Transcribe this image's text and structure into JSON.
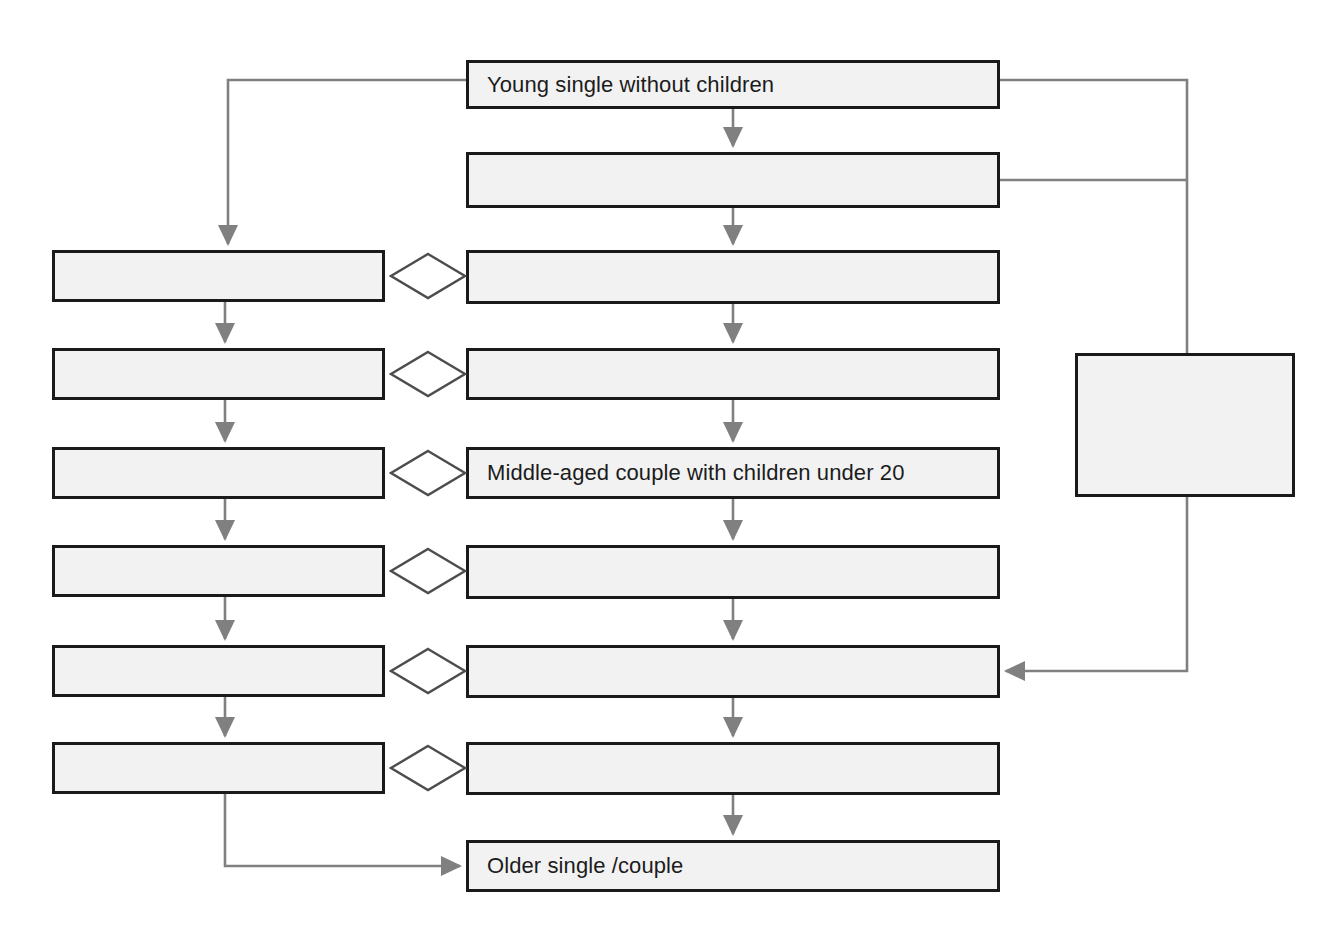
{
  "diagram": {
    "type": "flowchart",
    "canvas": {
      "width": 1342,
      "height": 932
    },
    "style": {
      "node_fill": "#f2f2f2",
      "node_border": "#1a1a1a",
      "edge_color": "#808080",
      "text_color": "#1c1c1c",
      "background": "#ffffff"
    },
    "columns": {
      "left_label": "",
      "middle_label": "",
      "right_label": ""
    },
    "nodes": [
      {
        "id": "m1",
        "label": "Young single without children",
        "column": "middle",
        "x": 466,
        "y": 60,
        "w": 534,
        "h": 49
      },
      {
        "id": "m2",
        "label": "",
        "column": "middle",
        "x": 466,
        "y": 152,
        "w": 534,
        "h": 56
      },
      {
        "id": "m3",
        "label": "",
        "column": "middle",
        "x": 466,
        "y": 250,
        "w": 534,
        "h": 54
      },
      {
        "id": "m4",
        "label": "",
        "column": "middle",
        "x": 466,
        "y": 348,
        "w": 534,
        "h": 52
      },
      {
        "id": "m5",
        "label": "Middle-aged couple with children under 20",
        "column": "middle",
        "x": 466,
        "y": 447,
        "w": 534,
        "h": 52
      },
      {
        "id": "m6",
        "label": "",
        "column": "middle",
        "x": 466,
        "y": 545,
        "w": 534,
        "h": 54
      },
      {
        "id": "m7",
        "label": "",
        "column": "middle",
        "x": 466,
        "y": 645,
        "w": 534,
        "h": 53
      },
      {
        "id": "m8",
        "label": "",
        "column": "middle",
        "x": 466,
        "y": 742,
        "w": 534,
        "h": 53
      },
      {
        "id": "m9",
        "label": "Older single /couple",
        "column": "middle",
        "x": 466,
        "y": 840,
        "w": 534,
        "h": 52
      },
      {
        "id": "l1",
        "label": "",
        "column": "left",
        "x": 52,
        "y": 250,
        "w": 333,
        "h": 52
      },
      {
        "id": "l2",
        "label": "",
        "column": "left",
        "x": 52,
        "y": 348,
        "w": 333,
        "h": 52
      },
      {
        "id": "l3",
        "label": "",
        "column": "left",
        "x": 52,
        "y": 447,
        "w": 333,
        "h": 52
      },
      {
        "id": "l4",
        "label": "",
        "column": "left",
        "x": 52,
        "y": 545,
        "w": 333,
        "h": 52
      },
      {
        "id": "l5",
        "label": "",
        "column": "left",
        "x": 52,
        "y": 645,
        "w": 333,
        "h": 52
      },
      {
        "id": "l6",
        "label": "",
        "column": "left",
        "x": 52,
        "y": 742,
        "w": 333,
        "h": 52
      },
      {
        "id": "r1",
        "label": "",
        "column": "right",
        "x": 1075,
        "y": 353,
        "w": 220,
        "h": 144
      }
    ],
    "diamonds": [
      {
        "id": "d1",
        "cx": 428,
        "cy": 276,
        "rx": 37,
        "ry": 22
      },
      {
        "id": "d2",
        "cx": 428,
        "cy": 374,
        "rx": 37,
        "ry": 22
      },
      {
        "id": "d3",
        "cx": 428,
        "cy": 473,
        "rx": 37,
        "ry": 22
      },
      {
        "id": "d4",
        "cx": 428,
        "cy": 571,
        "rx": 37,
        "ry": 22
      },
      {
        "id": "d5",
        "cx": 428,
        "cy": 671,
        "rx": 37,
        "ry": 22
      },
      {
        "id": "d6",
        "cx": 428,
        "cy": 768,
        "rx": 37,
        "ry": 22
      }
    ],
    "edges": [
      {
        "id": "e-m1-m2",
        "from": "m1",
        "to": "m2",
        "kind": "arrow",
        "path": "M733,109 L733,146"
      },
      {
        "id": "e-m2-m3",
        "from": "m2",
        "to": "m3",
        "kind": "arrow",
        "path": "M733,208 L733,244"
      },
      {
        "id": "e-m3-m4",
        "from": "m3",
        "to": "m4",
        "kind": "arrow",
        "path": "M733,304 L733,342"
      },
      {
        "id": "e-m4-m5",
        "from": "m4",
        "to": "m5",
        "kind": "arrow",
        "path": "M733,400 L733,441"
      },
      {
        "id": "e-m5-m6",
        "from": "m5",
        "to": "m6",
        "kind": "arrow",
        "path": "M733,499 L733,539"
      },
      {
        "id": "e-m6-m7",
        "from": "m6",
        "to": "m7",
        "kind": "arrow",
        "path": "M733,599 L733,639"
      },
      {
        "id": "e-m7-m8",
        "from": "m7",
        "to": "m8",
        "kind": "arrow",
        "path": "M733,698 L733,736"
      },
      {
        "id": "e-m8-m9",
        "from": "m8",
        "to": "m9",
        "kind": "arrow",
        "path": "M733,795 L733,834"
      },
      {
        "id": "e-l1-l2",
        "from": "l1",
        "to": "l2",
        "kind": "arrow",
        "path": "M225,302 L225,342"
      },
      {
        "id": "e-l2-l3",
        "from": "l2",
        "to": "l3",
        "kind": "arrow",
        "path": "M225,400 L225,441"
      },
      {
        "id": "e-l3-l4",
        "from": "l3",
        "to": "l4",
        "kind": "arrow",
        "path": "M225,499 L225,539"
      },
      {
        "id": "e-l4-l5",
        "from": "l4",
        "to": "l5",
        "kind": "arrow",
        "path": "M225,597 L225,639"
      },
      {
        "id": "e-l5-l6",
        "from": "l5",
        "to": "l6",
        "kind": "arrow",
        "path": "M225,697 L225,736"
      },
      {
        "id": "e-m1-l1",
        "from": "m1",
        "to": "l1",
        "kind": "arrow",
        "path": "M466,80 L228,80 L228,244"
      },
      {
        "id": "e-m1-r1",
        "from": "m1",
        "to": "r1",
        "kind": "plain",
        "path": "M1000,80 L1187,80 L1187,353"
      },
      {
        "id": "e-m2-r1",
        "from": "m2",
        "to": "r1",
        "kind": "plain",
        "path": "M1000,180 L1187,180"
      },
      {
        "id": "e-r1-m7",
        "from": "r1",
        "to": "m7",
        "kind": "arrow",
        "path": "M1187,497 L1187,671 L1006,671"
      },
      {
        "id": "e-l6-m9",
        "from": "l6",
        "to": "m9",
        "kind": "arrow",
        "path": "M225,794 L225,866 L460,866"
      }
    ]
  }
}
